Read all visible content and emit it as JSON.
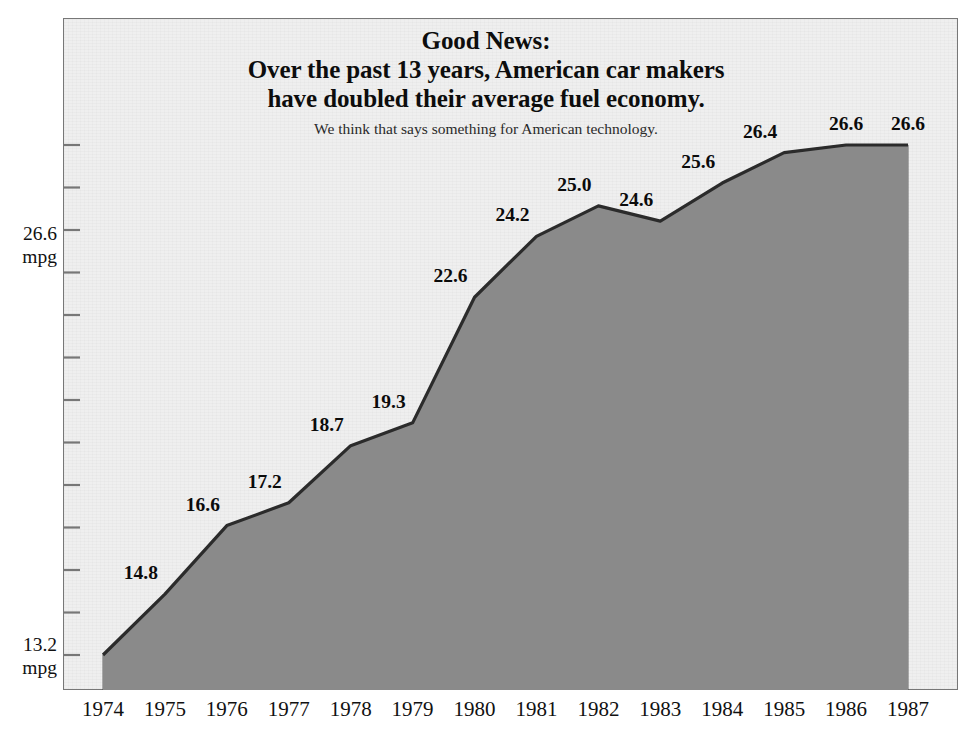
{
  "chart_data": {
    "type": "area",
    "title_lines": [
      "Good News:",
      "Over the past 13 years, American car makers",
      "have doubled their average fuel economy."
    ],
    "subtitle": "We think that says something for American technology.",
    "categories": [
      "1974",
      "1975",
      "1976",
      "1977",
      "1978",
      "1979",
      "1980",
      "1981",
      "1982",
      "1983",
      "1984",
      "1985",
      "1986",
      "1987"
    ],
    "values": [
      13.2,
      14.8,
      16.6,
      17.2,
      18.7,
      19.3,
      22.6,
      24.2,
      25.0,
      24.6,
      25.6,
      26.4,
      26.6,
      26.6
    ],
    "point_labels": [
      "",
      "14.8",
      "16.6",
      "17.2",
      "18.7",
      "19.3",
      "22.6",
      "24.2",
      "25.0",
      "24.6",
      "25.6",
      "26.4",
      "26.6",
      "26.6"
    ],
    "xlabel": "",
    "ylabel": "mpg",
    "unit": "mpg",
    "axis_labels": {
      "top_value": "26.6",
      "top_unit": "mpg",
      "bottom_value": "13.2",
      "bottom_unit": "mpg"
    },
    "ylim": [
      13.2,
      26.6
    ],
    "y_tick_count": 13,
    "grid": false,
    "legend": null,
    "colors": {
      "page_background": "#ffffff",
      "plot_background": "#efefef",
      "area_fill": "#8a8a8a",
      "area_line": "#2b2b2b",
      "frame": "#777777",
      "divider": "#4a4a4a",
      "text": "#111111"
    }
  }
}
